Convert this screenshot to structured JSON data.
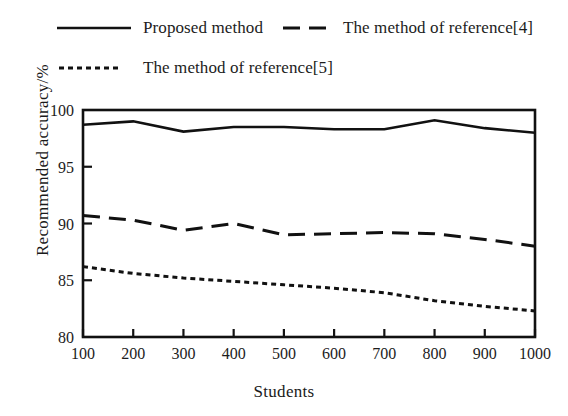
{
  "chart_data": {
    "type": "line",
    "title": "",
    "xlabel": "Students",
    "ylabel": "Recommended accuracy/%",
    "x": [
      100,
      200,
      300,
      400,
      500,
      600,
      700,
      800,
      900,
      1000
    ],
    "xticklabels": [
      "100",
      "200",
      "300",
      "400",
      "500",
      "600",
      "700",
      "800",
      "900",
      "1000"
    ],
    "yticklabels": [
      "80",
      "85",
      "90",
      "95",
      "100"
    ],
    "yticks": [
      80,
      85,
      90,
      95,
      100
    ],
    "xlim": [
      100,
      1000
    ],
    "ylim": [
      80,
      100
    ],
    "grid": false,
    "legend_position": "above-plot",
    "series": [
      {
        "name": "Proposed method",
        "style": "solid",
        "color": "#111111",
        "values": [
          98.7,
          99.0,
          98.1,
          98.5,
          98.5,
          98.3,
          98.3,
          99.1,
          98.4,
          98.0
        ]
      },
      {
        "name": "The method of reference[4]",
        "style": "dashed",
        "color": "#111111",
        "values": [
          90.7,
          90.3,
          89.4,
          90.0,
          89.0,
          89.1,
          89.2,
          89.1,
          88.6,
          88.0
        ]
      },
      {
        "name": "The method of reference[5]",
        "style": "dotted",
        "color": "#111111",
        "values": [
          86.2,
          85.6,
          85.2,
          84.9,
          84.6,
          84.3,
          83.9,
          83.2,
          82.7,
          82.3
        ]
      }
    ]
  },
  "legend": {
    "items": [
      {
        "label": "Proposed method",
        "style": "solid"
      },
      {
        "label": "The method of reference[4]",
        "style": "dashed"
      },
      {
        "label": "The method of reference[5]",
        "style": "dotted"
      }
    ]
  },
  "axes": {
    "x_title": "Students",
    "y_title": "Recommended accuracy/%"
  }
}
